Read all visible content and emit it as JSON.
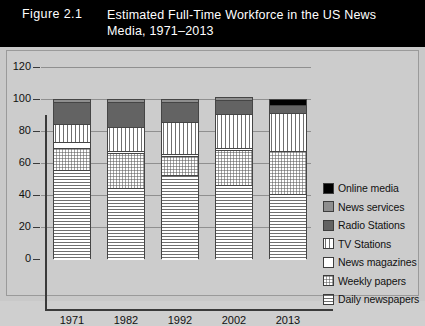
{
  "figure": {
    "number": "Figure 2.1",
    "caption": "Estimated Full-Time Workforce in the US News Media, 1971–2013"
  },
  "chart_data": {
    "type": "bar",
    "stacked": true,
    "title": "Estimated Full-Time Workforce in the US News Media, 1971–2013",
    "xlabel": "",
    "ylabel": "",
    "categories": [
      "1971",
      "1982",
      "1992",
      "2002",
      "2013"
    ],
    "ylim": [
      0,
      120
    ],
    "yticks": [
      0,
      20,
      40,
      60,
      80,
      100,
      120
    ],
    "grid": true,
    "legend_position": "right",
    "series": [
      {
        "name": "Daily newspapers",
        "values": [
          56,
          45,
          53,
          47,
          41
        ],
        "pattern": "horizontal-lines",
        "color": "#ffffff"
      },
      {
        "name": "Weekly papers",
        "values": [
          14,
          22,
          12,
          22,
          27
        ],
        "pattern": "dots",
        "color": "#ffffff"
      },
      {
        "name": "News magazines",
        "values": [
          4,
          1,
          1,
          1,
          0
        ],
        "pattern": "solid-white",
        "color": "#ffffff"
      },
      {
        "name": "TV Stations",
        "values": [
          11,
          15,
          20,
          21,
          24
        ],
        "pattern": "vertical-lines",
        "color": "#ffffff"
      },
      {
        "name": "Radio Stations",
        "values": [
          14,
          16,
          13,
          9,
          5
        ],
        "pattern": "solid-dark-gray",
        "color": "#636363"
      },
      {
        "name": "News services",
        "values": [
          1,
          1,
          1,
          1,
          0
        ],
        "pattern": "solid-gray",
        "color": "#8e8e8e"
      },
      {
        "name": "Online media",
        "values": [
          0,
          0,
          0,
          0,
          3
        ],
        "pattern": "solid-black",
        "color": "#000000"
      }
    ],
    "totals": [
      100,
      100,
      100,
      101,
      100
    ]
  },
  "legend": {
    "items": [
      {
        "label": "Online media",
        "swatch": "solid-black"
      },
      {
        "label": "News services",
        "swatch": "solid-gray"
      },
      {
        "label": "Radio Stations",
        "swatch": "solid-dark-gray"
      },
      {
        "label": "TV Stations",
        "swatch": "vertical-lines"
      },
      {
        "label": "News magazines",
        "swatch": "solid-white"
      },
      {
        "label": "Weekly papers",
        "swatch": "dots"
      },
      {
        "label": "Daily newspapers",
        "swatch": "horizontal-lines"
      }
    ]
  },
  "colors": {
    "banner_background": "#000000",
    "banner_text": "#ffffff",
    "panel_background": "#cccccc",
    "axis": "#3a3a3a",
    "gridline": "#8f8f8f"
  }
}
